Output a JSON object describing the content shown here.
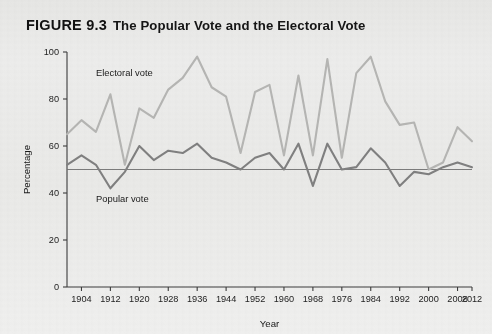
{
  "figure": {
    "number_label": "FIGURE 9.3",
    "title": "The Popular Vote and the Electoral Vote"
  },
  "colors": {
    "background": "#e9e9e7",
    "electoral_line": "#b5b5b3",
    "popular_line": "#808080",
    "axis": "#3c3c3c",
    "reference_line": "#6e6e6e",
    "text": "#1b1b1b"
  },
  "annotations": {
    "electoral_label": "Electoral vote",
    "popular_label": "Popular vote"
  },
  "chart_data": {
    "type": "line",
    "title": "The Popular Vote and the Electoral Vote",
    "xlabel": "Year",
    "ylabel": "Percentage",
    "xlim": [
      1900,
      2012
    ],
    "ylim": [
      0,
      100
    ],
    "grid": false,
    "legend_position": "inline-annotations",
    "yticks": [
      0,
      20,
      40,
      60,
      80,
      100
    ],
    "xticks": [
      1904,
      1912,
      1920,
      1928,
      1936,
      1944,
      1952,
      1960,
      1968,
      1976,
      1984,
      1992,
      2000,
      2008,
      2012
    ],
    "xtick_labels": [
      "1904",
      "1912",
      "1920",
      "1928",
      "1936",
      "1944",
      "1952",
      "1960",
      "1968",
      "1976",
      "1984",
      "1992",
      "2000",
      "2008",
      "2012"
    ],
    "ytick_labels": [
      "0",
      "20",
      "40",
      "60",
      "80",
      "100"
    ],
    "reference_line": {
      "y": 50,
      "label": "50 percent"
    },
    "x": [
      1900,
      1904,
      1908,
      1912,
      1916,
      1920,
      1924,
      1928,
      1932,
      1936,
      1940,
      1944,
      1948,
      1952,
      1956,
      1960,
      1964,
      1968,
      1972,
      1976,
      1980,
      1984,
      1988,
      1992,
      1996,
      2000,
      2004,
      2008,
      2012
    ],
    "series": [
      {
        "name": "Electoral vote",
        "color": "#b5b5b3",
        "values": [
          65,
          71,
          66,
          82,
          52,
          76,
          72,
          84,
          89,
          98,
          85,
          81,
          57,
          83,
          86,
          56,
          90,
          56,
          97,
          55,
          91,
          98,
          79,
          69,
          70,
          50,
          53,
          68,
          62
        ]
      },
      {
        "name": "Popular vote",
        "color": "#808080",
        "values": [
          52,
          56,
          52,
          42,
          49,
          60,
          54,
          58,
          57,
          61,
          55,
          53,
          50,
          55,
          57,
          50,
          61,
          43,
          61,
          50,
          51,
          59,
          53,
          43,
          49,
          48,
          51,
          53,
          51
        ]
      }
    ]
  }
}
